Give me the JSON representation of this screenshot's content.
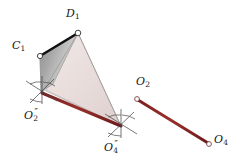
{
  "figure": {
    "type": "geometric-diagram",
    "background_color": "#ffffff",
    "colors": {
      "axis_line": "#8B2525",
      "axis_line_dark": "#5d1616",
      "gray_face_light": "#d2d2d2",
      "gray_face_dark": "#828282",
      "rose_face": "#e9dedc",
      "edge_thin": "#9a9a9a",
      "edge_thick": "#111111",
      "marker_stroke": "#3a3a3a",
      "marker_fill": "#ffffff",
      "label_color": "#161616"
    },
    "labels": [
      {
        "id": "C1",
        "base": "C",
        "sub": "1",
        "primes": "",
        "x": 12,
        "y": 40
      },
      {
        "id": "D1",
        "base": "D",
        "sub": "1",
        "primes": "",
        "x": 66,
        "y": 8
      },
      {
        "id": "O2pp",
        "base": "O",
        "sub": "2",
        "primes": "″",
        "x": 24,
        "y": 108
      },
      {
        "id": "O4pp",
        "base": "O",
        "sub": "4",
        "primes": "″",
        "x": 104,
        "y": 140
      },
      {
        "id": "O2",
        "base": "O",
        "sub": "2",
        "primes": "",
        "x": 136,
        "y": 76
      },
      {
        "id": "O4",
        "base": "O",
        "sub": "4",
        "primes": "",
        "x": 214,
        "y": 134
      }
    ],
    "points": [
      {
        "id": "C1",
        "x": 40,
        "y": 56,
        "marker": "open-circle"
      },
      {
        "id": "D1",
        "x": 78,
        "y": 33,
        "marker": "open-circle"
      },
      {
        "id": "O2pp",
        "x": 42,
        "y": 93,
        "marker": "crosshair-burst"
      },
      {
        "id": "O4pp",
        "x": 121,
        "y": 126,
        "marker": "crosshair-burst"
      },
      {
        "id": "O2",
        "x": 137,
        "y": 99,
        "marker": "open-circle"
      },
      {
        "id": "O4",
        "x": 209,
        "y": 144,
        "marker": "open-circle"
      }
    ],
    "faces": [
      {
        "id": "gray-quad",
        "fill": "gradient-gray",
        "vertices": "40,56 78,33 52,86 41,92"
      },
      {
        "id": "rose-triangle",
        "fill": "#e9dedc",
        "vertices": "78,33 121,126 46,90"
      }
    ],
    "edges": [
      {
        "id": "C1-D1",
        "weight": "thick",
        "from": "C1",
        "to": "D1"
      },
      {
        "id": "C1-O2pp",
        "weight": "thin",
        "from": "C1",
        "to": "O2pp"
      },
      {
        "id": "D1-O2pp",
        "weight": "thin",
        "from": "D1",
        "to": "O2pp"
      },
      {
        "id": "D1-O4pp",
        "weight": "thin",
        "from": "D1",
        "to": "O4pp"
      },
      {
        "id": "O2pp-O4pp-ray",
        "weight": "thin",
        "from": "O2pp",
        "to": "O4pp"
      }
    ],
    "axis_lines": [
      {
        "id": "axis-double-prime",
        "from": "O2pp",
        "to": "O4pp",
        "color": "#8B2525"
      },
      {
        "id": "axis-plain",
        "from": "O2",
        "to": "O4",
        "color": "#8B2525"
      }
    ]
  }
}
